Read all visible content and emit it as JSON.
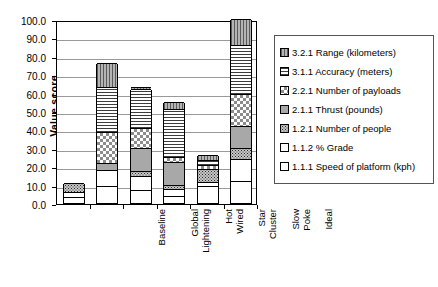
{
  "chart_data": {
    "type": "bar",
    "subtype": "stacked-bar",
    "title": "",
    "xlabel": "",
    "ylabel": "Value score",
    "ylim": [
      0.0,
      100.0
    ],
    "ytick_labels": [
      "100.0",
      "90.0",
      "80.0",
      "70.0",
      "60.0",
      "50.0",
      "40.0",
      "30.0",
      "20.0",
      "10.0",
      "0.0"
    ],
    "ytick_values": [
      100.0,
      90.0,
      80.0,
      70.0,
      60.0,
      50.0,
      40.0,
      30.0,
      20.0,
      10.0,
      0.0
    ],
    "grid": true,
    "legend_position": "right",
    "categories": [
      "Baseline",
      "Global Lightening",
      "Hot Wired",
      "Star Cluster",
      "Slow Poke",
      "Ideal"
    ],
    "series": [
      {
        "name": "3.2.1 Range (kilometers)",
        "pattern": "vertical-lines",
        "values": [
          0.0,
          13.0,
          1.0,
          4.0,
          2.5,
          14.0
        ]
      },
      {
        "name": "3.1.1 Accuracy (meters)",
        "pattern": "horizontal-lines",
        "values": [
          0.0,
          24.5,
          21.0,
          26.0,
          3.0,
          27.0
        ]
      },
      {
        "name": "2.2.1 Number of payloads",
        "pattern": "checkerboard",
        "values": [
          0.0,
          16.5,
          11.0,
          2.5,
          2.0,
          17.0
        ]
      },
      {
        "name": "2.1.1 Thrust (pounds)",
        "pattern": "solid-gray",
        "values": [
          0.0,
          4.0,
          12.5,
          12.5,
          0.0,
          12.0
        ]
      },
      {
        "name": "1.2.1 Number of people",
        "pattern": "dense-dots",
        "values": [
          5.0,
          0.0,
          3.0,
          2.5,
          7.0,
          6.0
        ]
      },
      {
        "name": "1.1.2 % Grade",
        "pattern": "white",
        "values": [
          3.0,
          9.0,
          7.5,
          3.5,
          2.0,
          12.0
        ]
      },
      {
        "name": "1.1.1 Speed of platform (kph)",
        "pattern": "white",
        "values": [
          3.0,
          9.0,
          7.0,
          4.0,
          9.5,
          12.0
        ]
      }
    ],
    "totals": [
      11.0,
      76.0,
      62.0,
      55.0,
      26.0,
      100.0
    ]
  },
  "legend": {
    "items": [
      {
        "label": "3.2.1 Range (kilometers)",
        "swatch": "vertical-lines"
      },
      {
        "label": "3.1.1 Accuracy (meters)",
        "swatch": "horizontal-lines"
      },
      {
        "label": "2.2.1 Number of payloads",
        "swatch": "checkerboard"
      },
      {
        "label": "2.1.1 Thrust (pounds)",
        "swatch": "solid-gray"
      },
      {
        "label": "1.2.1 Number of people",
        "swatch": "dense-dots"
      },
      {
        "label": "1.1.2 % Grade",
        "swatch": "white"
      },
      {
        "label": "1.1.1 Speed of platform (kph)",
        "swatch": "white"
      }
    ]
  },
  "colors": {
    "axis": "#000000",
    "grid": "#999999",
    "background": "#ffffff",
    "legend_border": "#555555"
  }
}
